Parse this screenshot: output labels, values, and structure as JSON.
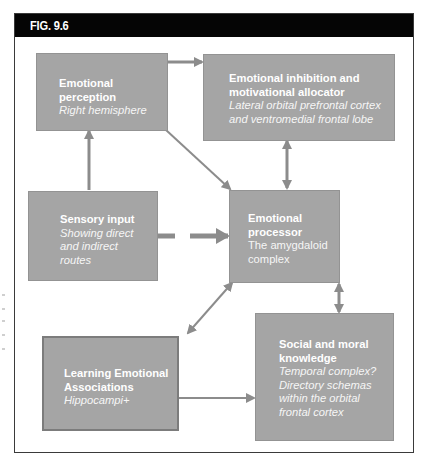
{
  "figure": {
    "label": "FIG. 9.6"
  },
  "colors": {
    "header_bg": "#050505",
    "box_fill": "#a5a5a5",
    "arrow": "#8c8c8c",
    "text": "#ffffff"
  },
  "nodes": {
    "emotional_perception": {
      "title_line1": "Emotional",
      "title_line2": "perception",
      "subtitle": "Right hemisphere"
    },
    "emotional_inhibition": {
      "title_line1": "Emotional inhibition and",
      "title_line2": "motivational allocator",
      "subtitle_line1": "Lateral orbital prefrontal cortex",
      "subtitle_line2": "and ventromedial frontal lobe"
    },
    "sensory_input": {
      "title": "Sensory input",
      "subtitle_line1": "Showing direct",
      "subtitle_line2": "and indirect",
      "subtitle_line3": "routes"
    },
    "emotional_processor": {
      "title_line1": "Emotional",
      "title_line2": "processor",
      "subtitle_line1": "The amygdaloid",
      "subtitle_line2": "complex"
    },
    "learning_associations": {
      "title_line1": "Learning Emotional",
      "title_line2": "Associations",
      "subtitle": "Hippocampi+"
    },
    "social_moral_knowledge": {
      "title_line1": "Social and moral",
      "title_line2": "knowledge",
      "subtitle_line1": "Temporal complex?",
      "subtitle_line2": "Directory schemas",
      "subtitle_line3": "within the orbital",
      "subtitle_line4": "frontal cortex"
    }
  },
  "edges": [
    {
      "from": "emotional_perception",
      "to": "emotional_inhibition",
      "type": "one-way"
    },
    {
      "from": "sensory_input",
      "to": "emotional_perception",
      "type": "one-way"
    },
    {
      "from": "emotional_perception",
      "to": "emotional_processor",
      "type": "one-way"
    },
    {
      "from": "emotional_inhibition",
      "to": "emotional_processor",
      "type": "two-way"
    },
    {
      "from": "sensory_input",
      "to": "emotional_processor",
      "type": "one-way-dashed"
    },
    {
      "from": "emotional_processor",
      "to": "learning_associations",
      "type": "two-way"
    },
    {
      "from": "emotional_processor",
      "to": "social_moral_knowledge",
      "type": "two-way"
    },
    {
      "from": "learning_associations",
      "to": "social_moral_knowledge",
      "type": "one-way"
    }
  ]
}
